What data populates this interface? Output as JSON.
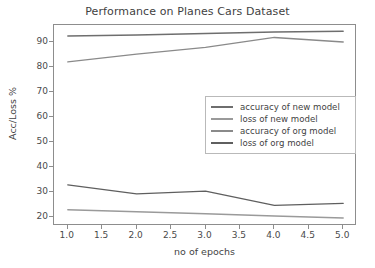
{
  "chart_data": {
    "type": "line",
    "title": "Performance on Planes Cars Dataset",
    "xlabel": "no of epochs",
    "ylabel": "Acc/Loss %",
    "x": [
      1.0,
      2.0,
      3.0,
      4.0,
      5.0
    ],
    "xlim": [
      0.8,
      5.2
    ],
    "ylim": [
      16.5,
      97.0
    ],
    "xticks": [
      "1.0",
      "1.5",
      "2.0",
      "2.5",
      "3.0",
      "3.5",
      "4.0",
      "4.5",
      "5.0"
    ],
    "xtick_values": [
      1.0,
      1.5,
      2.0,
      2.5,
      3.0,
      3.5,
      4.0,
      4.5,
      5.0
    ],
    "yticks": [
      "20",
      "30",
      "40",
      "50",
      "60",
      "70",
      "80",
      "90"
    ],
    "ytick_values": [
      20,
      30,
      40,
      50,
      60,
      70,
      80,
      90
    ],
    "grid": false,
    "legend_position": "center right",
    "series": [
      {
        "name": "accuracy of new model",
        "color": "#6e6e6e",
        "values": [
          92.6,
          93.0,
          93.6,
          94.2,
          94.5
        ]
      },
      {
        "name": "loss of new model",
        "color": "#9a9a9a",
        "values": [
          23.0,
          22.2,
          21.4,
          20.5,
          19.7
        ]
      },
      {
        "name": "accuracy of org model",
        "color": "#8a8a8a",
        "values": [
          82.2,
          85.3,
          88.0,
          92.0,
          90.2
        ]
      },
      {
        "name": "loss of org model",
        "color": "#5f5f5f",
        "values": [
          33.0,
          29.4,
          30.5,
          24.8,
          25.6
        ]
      }
    ]
  },
  "colors": {
    "axis": "#8d8d8d",
    "text": "#3f3f3f",
    "legend_border": "#b9b9b9",
    "background": "#ffffff"
  }
}
